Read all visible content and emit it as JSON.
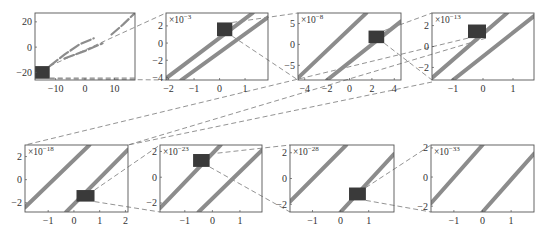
{
  "figure": {
    "colors": {
      "curve": "#8c8c8c",
      "box": "#3a3a3a",
      "frame": "#555555",
      "connector": "#777777"
    }
  },
  "chart_data": [
    {
      "type": "line",
      "panel": 1,
      "scale_label": "",
      "xlim": [
        -17,
        17
      ],
      "ylim": [
        -26,
        27
      ],
      "xticks": [
        "-10",
        "0",
        "10"
      ],
      "yticks": [
        "20",
        "0",
        "-20"
      ],
      "series": [
        {
          "name": "branch-a",
          "style": "dashed",
          "x": [
            -12,
            -7,
            -2,
            3
          ],
          "y": [
            -15,
            -6,
            2,
            7
          ]
        },
        {
          "name": "branch-b",
          "style": "dashed",
          "x": [
            -7,
            0,
            6
          ],
          "y": [
            -9,
            -3,
            3
          ]
        },
        {
          "name": "branch-c",
          "style": "dashed",
          "x": [
            9,
            13,
            17
          ],
          "y": [
            10,
            18,
            27
          ]
        }
      ],
      "zoom_box": {
        "x": [
          -17,
          -12
        ],
        "y": [
          -25,
          -15
        ]
      }
    },
    {
      "type": "line",
      "panel": 2,
      "scale_label": "×10^-3",
      "xlim": [
        -2.1,
        1.9
      ],
      "ylim": [
        -4.3,
        3.5
      ],
      "xticks": [
        "-2",
        "-1",
        "0",
        "1"
      ],
      "yticks": [
        "2",
        "0",
        "-2",
        "-4"
      ],
      "series": [
        {
          "name": "line-1",
          "x": [
            -2.1,
            1.3
          ],
          "y": [
            -4.1,
            3.5
          ]
        },
        {
          "name": "line-2",
          "x": [
            -1.5,
            1.9
          ],
          "y": [
            -4.3,
            3.0
          ]
        }
      ],
      "zoom_box": {
        "x": [
          -0.1,
          0.5
        ],
        "y": [
          0.8,
          2.4
        ]
      }
    },
    {
      "type": "line",
      "panel": 3,
      "scale_label": "×10^-8",
      "xlim": [
        -4.6,
        4.6
      ],
      "ylim": [
        -8.5,
        7.5
      ],
      "xticks": [
        "-4",
        "-2",
        "0",
        "2",
        "4"
      ],
      "yticks": [
        "5",
        "0",
        "-5"
      ],
      "series": [
        {
          "name": "line-1",
          "x": [
            -4.6,
            1.5
          ],
          "y": [
            -8,
            7.5
          ]
        },
        {
          "name": "line-2",
          "x": [
            -2,
            4.6
          ],
          "y": [
            -8.5,
            5.5
          ]
        }
      ],
      "zoom_box": {
        "x": [
          1.7,
          3.1
        ],
        "y": [
          0.3,
          3.3
        ]
      }
    },
    {
      "type": "line",
      "panel": 4,
      "scale_label": "×10^-13",
      "xlim": [
        -1.7,
        1.7
      ],
      "ylim": [
        -3.2,
        3.2
      ],
      "xticks": [
        "-1",
        "0",
        "1"
      ],
      "yticks": [
        "2",
        "0",
        "-2"
      ],
      "series": [
        {
          "name": "line-1",
          "x": [
            -1.7,
            0.8
          ],
          "y": [
            -3.0,
            3.2
          ]
        },
        {
          "name": "line-2",
          "x": [
            -1.0,
            1.7
          ],
          "y": [
            -3.2,
            2.9
          ]
        }
      ],
      "zoom_box": {
        "x": [
          -0.5,
          0.1
        ],
        "y": [
          0.8,
          2.1
        ]
      }
    },
    {
      "type": "line",
      "panel": 5,
      "scale_label": "×10^-18",
      "xlim": [
        -1.9,
        2.1
      ],
      "ylim": [
        -2.8,
        3.0
      ],
      "xticks": [
        "-1",
        "0",
        "1",
        "2"
      ],
      "yticks": [
        "2",
        "0",
        "-2"
      ],
      "series": [
        {
          "name": "line-1",
          "x": [
            -1.9,
            0.6
          ],
          "y": [
            -2.4,
            3.0
          ]
        },
        {
          "name": "line-2",
          "x": [
            -0.3,
            2.1
          ],
          "y": [
            -2.8,
            2.6
          ]
        }
      ],
      "zoom_box": {
        "x": [
          0.1,
          0.8
        ],
        "y": [
          -1.9,
          -0.9
        ]
      }
    },
    {
      "type": "line",
      "panel": 6,
      "scale_label": "×10^-23",
      "xlim": [
        -1.9,
        1.8
      ],
      "ylim": [
        -2.7,
        2.5
      ],
      "xticks": [
        "-1",
        "0",
        "1"
      ],
      "yticks": [
        "2",
        "0",
        "-2"
      ],
      "series": [
        {
          "name": "line-1",
          "x": [
            -1.9,
            0.3
          ],
          "y": [
            -2.4,
            2.5
          ]
        },
        {
          "name": "line-2",
          "x": [
            -0.5,
            1.8
          ],
          "y": [
            -2.7,
            2.1
          ]
        }
      ],
      "zoom_box": {
        "x": [
          -0.7,
          -0.1
        ],
        "y": [
          0.8,
          1.8
        ]
      }
    },
    {
      "type": "line",
      "panel": 7,
      "scale_label": "×10^-28",
      "xlim": [
        -1.8,
        1.9
      ],
      "ylim": [
        -2.6,
        2.6
      ],
      "xticks": [
        "-1",
        "0",
        "1"
      ],
      "yticks": [
        "2",
        "0",
        "-2"
      ],
      "series": [
        {
          "name": "line-1",
          "x": [
            -1.8,
            0.2
          ],
          "y": [
            -1.8,
            2.6
          ]
        },
        {
          "name": "line-2",
          "x": [
            0.0,
            1.9
          ],
          "y": [
            -2.6,
            1.9
          ]
        }
      ],
      "zoom_box": {
        "x": [
          0.3,
          0.9
        ],
        "y": [
          -1.7,
          -0.7
        ]
      }
    },
    {
      "type": "line",
      "panel": 8,
      "scale_label": "×10^-33",
      "xlim": [
        -1.8,
        1.8
      ],
      "ylim": [
        -2.4,
        2.2
      ],
      "xticks": [
        "-1",
        "0",
        "1"
      ],
      "yticks": [
        "2",
        "0",
        "-2"
      ],
      "series": [
        {
          "name": "line-1",
          "x": [
            -1.8,
            0.0
          ],
          "y": [
            -1.8,
            2.2
          ]
        },
        {
          "name": "line-2",
          "x": [
            0.0,
            1.8
          ],
          "y": [
            -2.4,
            1.6
          ]
        }
      ]
    }
  ]
}
